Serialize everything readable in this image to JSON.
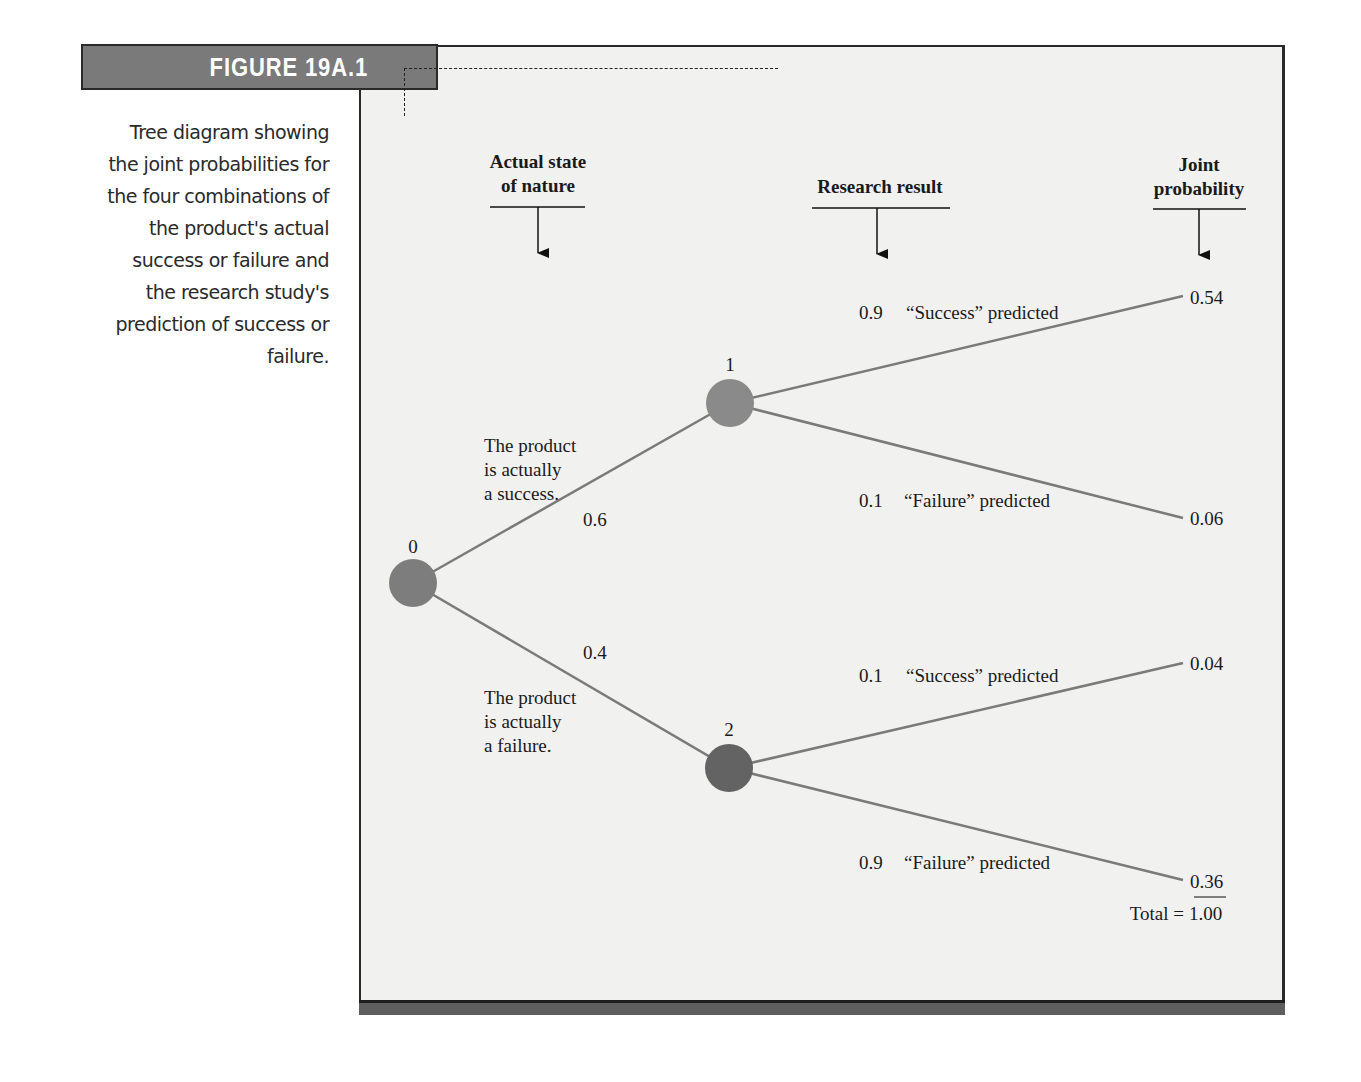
{
  "figure": {
    "label": "FIGURE 19A.1",
    "caption": "Tree diagram showing the joint probabilities for the four combinations of the product's actual success or failure and the research study's prediction of success or failure.",
    "caption_lines": [
      "Tree diagram showing",
      "the joint probabilities for",
      "the four combinations of",
      "the product's actual",
      "success or failure and",
      "the research study's",
      "prediction of success or",
      "failure."
    ]
  },
  "columns": {
    "state_of_nature": {
      "line1": "Actual state",
      "line2": "of nature"
    },
    "research_result": {
      "line1": "Research result"
    },
    "joint_probability": {
      "line1": "Joint",
      "line2": "probability"
    }
  },
  "nodes": [
    {
      "id": "0",
      "label": "0",
      "color": "#7d7d7d"
    },
    {
      "id": "1",
      "label": "1",
      "color": "#8a8a8a"
    },
    {
      "id": "2",
      "label": "2",
      "color": "#636363"
    }
  ],
  "branches": {
    "success": {
      "probability": "0.6",
      "text_lines": [
        "The product",
        "is actually",
        "a success."
      ]
    },
    "failure": {
      "probability": "0.4",
      "text_lines": [
        "The product",
        "is actually",
        "a failure."
      ]
    }
  },
  "outcomes": [
    {
      "from_node": "1",
      "probability": "0.9",
      "prediction": "“Success” predicted",
      "joint": "0.54"
    },
    {
      "from_node": "1",
      "probability": "0.1",
      "prediction": "“Failure” predicted",
      "joint": "0.06"
    },
    {
      "from_node": "2",
      "probability": "0.1",
      "prediction": "“Success” predicted",
      "joint": "0.04"
    },
    {
      "from_node": "2",
      "probability": "0.9",
      "prediction": "“Failure” predicted",
      "joint": "0.36"
    }
  ],
  "total": {
    "label": "Total =",
    "value": "1.00"
  },
  "colors": {
    "panel_bg": "#f1f1f0",
    "label_bg": "#7a7a7a",
    "branch_line": "#7a7a7a",
    "border": "#2a2a2a"
  }
}
